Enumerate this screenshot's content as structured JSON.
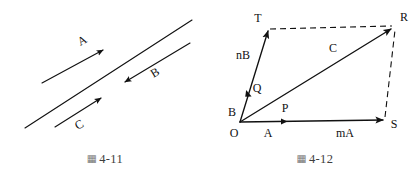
{
  "figures": [
    {
      "id": "fig-4-11",
      "caption_glyph": "▦",
      "caption": "4-11",
      "description": "Three parallel vector arrows along a common line direction",
      "labels": {
        "a": "A",
        "b": "B",
        "c": "C"
      },
      "geometry": {
        "baseline": {
          "x1": 25,
          "y1": 128,
          "x2": 192,
          "y2": 20
        },
        "arrow_a": {
          "x1": 42,
          "y1": 83,
          "x2": 106,
          "y2": 49,
          "direction": "up-right"
        },
        "arrow_b": {
          "x1": 190,
          "y1": 43,
          "x2": 122,
          "y2": 83,
          "direction": "down-left"
        },
        "arrow_c": {
          "x1": 55,
          "y1": 127,
          "x2": 104,
          "y2": 96,
          "direction": "up-right"
        }
      }
    },
    {
      "id": "fig-4-12",
      "caption_glyph": "▦",
      "caption": "4-12",
      "description": "Parallelogram OTRS showing vector addition mA + nB = C",
      "labels": {
        "o": "O",
        "t": "T",
        "r": "R",
        "s": "S",
        "p": "P",
        "q": "Q",
        "a": "A",
        "b": "B",
        "c": "C",
        "ma": "mA",
        "nb": "nB"
      },
      "geometry": {
        "vertex_o": {
          "x": 240,
          "y": 122
        },
        "vertex_t": {
          "x": 268,
          "y": 29
        },
        "vertex_r": {
          "x": 394,
          "y": 26
        },
        "vertex_s": {
          "x": 385,
          "y": 120
        },
        "marker_q": {
          "x": 248,
          "y": 94
        },
        "marker_p": {
          "x": 285,
          "y": 122
        },
        "edge_ot": {
          "style": "solid",
          "arrow": true
        },
        "edge_os": {
          "style": "solid",
          "arrow": true
        },
        "edge_or": {
          "style": "solid",
          "arrow": true
        },
        "edge_tr": {
          "style": "dashed",
          "arrow": false
        },
        "edge_sr": {
          "style": "dashed",
          "arrow": false
        }
      }
    }
  ],
  "colors": {
    "ink": "#111111",
    "caption": "#3d3d3d",
    "glyph": "#777777",
    "background": "#ffffff"
  }
}
